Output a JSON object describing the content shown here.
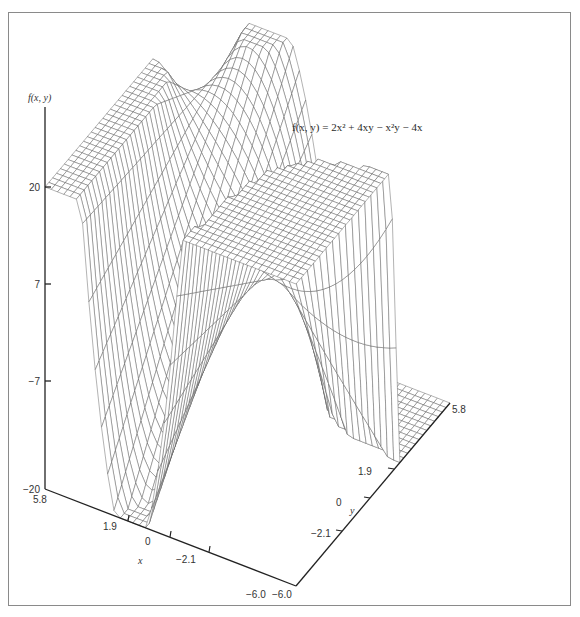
{
  "chart_data": {
    "type": "surface-3d-wireframe",
    "title": "",
    "annotation": "f(x, y) = 2x² + 4xy − x²y − 4x",
    "function": "f(x, y) = 2x^2 + 4xy - x^2*y - 4x",
    "xlabel": "x",
    "ylabel": "y",
    "zlabel": "f(x, y)",
    "x_ticks": [
      "5.8",
      "1.9",
      "0",
      "−2.1",
      "−6.0"
    ],
    "x_tick_values": [
      5.8,
      1.9,
      0,
      -2.1,
      -6.0
    ],
    "y_ticks": [
      "−6.0",
      "−2.1",
      "0",
      "1.9",
      "5.8"
    ],
    "y_tick_values": [
      -6.0,
      -2.1,
      0,
      1.9,
      5.8
    ],
    "z_ticks": [
      "20",
      "7",
      "−7",
      "−20"
    ],
    "z_tick_values": [
      20,
      7,
      -7,
      -20
    ],
    "xlim": [
      -6.0,
      5.8
    ],
    "ylim": [
      -6.0,
      5.8
    ],
    "zlim": [
      -20,
      20
    ],
    "clipping": "surface values clipped to z range [-20, 20], producing flat plateaus",
    "grid": false,
    "legend": "none"
  },
  "labels": {
    "z_axis_title": "f(x, y)",
    "x_axis_title": "x",
    "y_axis_title": "y",
    "equation": "f(x, y) = 2x² + 4xy − x²y − 4x",
    "z_ticks": [
      "20",
      "7",
      "−7",
      "−20"
    ],
    "x_ticks": [
      "5.8",
      "1.9",
      "0",
      "−2.1",
      "−6.0"
    ],
    "y_ticks": [
      "−6.0",
      "−2.1",
      "0",
      "1.9",
      "5.8"
    ]
  },
  "colors": {
    "frame": "#8a8a8a",
    "axis": "#222222",
    "mesh": "#555555",
    "mesh_dark": "#222222",
    "background": "#ffffff"
  }
}
